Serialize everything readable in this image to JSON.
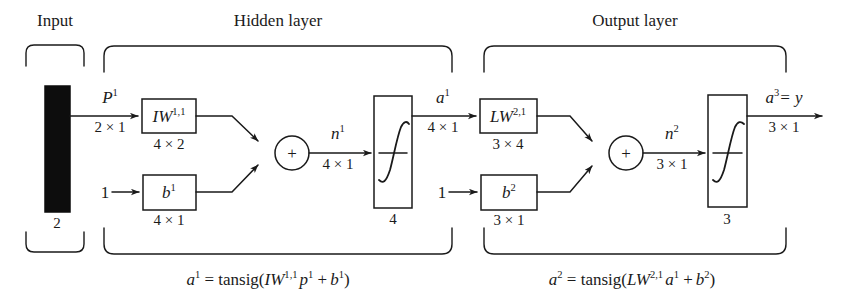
{
  "diagram": {
    "groups": {
      "input": "Input",
      "hidden": "Hidden layer",
      "output": "Output layer"
    },
    "input_block": {
      "name": "input-vector-block",
      "size_label": "2"
    },
    "hidden_layer": {
      "signal_in": {
        "symbol": "P",
        "superscript": "1",
        "dimension": "2 × 1"
      },
      "weight_box": {
        "symbol": "IW",
        "superscript": "1,1",
        "dimension": "4 × 2"
      },
      "bias_input": "1",
      "bias_box": {
        "symbol": "b",
        "superscript": "1",
        "dimension": "4 × 1"
      },
      "sum_symbol": "+",
      "net_input": {
        "symbol": "n",
        "superscript": "1",
        "dimension": "4 × 1"
      },
      "transfer_box": {
        "glyph": "f",
        "neurons": "4"
      },
      "output_signal": {
        "symbol": "a",
        "superscript": "1",
        "dimension": "4 × 1"
      },
      "equation": "a¹ = tansig(IW¹˒¹ p¹ + b¹)"
    },
    "output_layer": {
      "weight_box": {
        "symbol": "LW",
        "superscript": "2,1",
        "dimension": "3 × 4"
      },
      "bias_input": "1",
      "bias_box": {
        "symbol": "b",
        "superscript": "2",
        "dimension": "3 × 1"
      },
      "sum_symbol": "+",
      "net_input": {
        "symbol": "n",
        "superscript": "2",
        "dimension": "3 × 1"
      },
      "transfer_box": {
        "glyph": "f",
        "neurons": "3"
      },
      "output_signal": {
        "symbol": "a",
        "superscript": "3",
        "equals": "= y",
        "dimension": "3 × 1"
      },
      "equation": "a² = tansig(LW²˒¹ a¹ + b²)"
    },
    "equations": {
      "hidden_lhs": "a",
      "hidden_lhs_sup": "1",
      "hidden_rhs_pre": "= tansig(",
      "hidden_w": "IW",
      "hidden_w_sup": "1,1",
      "hidden_p": "p",
      "hidden_p_sup": "1",
      "hidden_plus": "+",
      "hidden_b": "b",
      "hidden_b_sup": "1",
      "hidden_close": ")",
      "out_lhs": "a",
      "out_lhs_sup": "2",
      "out_rhs_pre": "= tansig(",
      "out_w": "LW",
      "out_w_sup": "2,1",
      "out_a": "a",
      "out_a_sup": "1",
      "out_plus": "+",
      "out_b": "b",
      "out_b_sup": "2",
      "out_close": ")"
    },
    "colors": {
      "ink": "#1a1a1a",
      "paper": "#ffffff",
      "block_fill": "#0d0d0d"
    }
  }
}
